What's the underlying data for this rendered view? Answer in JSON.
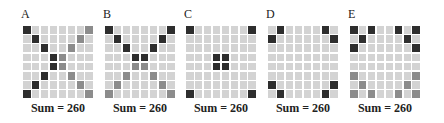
{
  "colors": {
    "dark": "#2e2e2e",
    "medium": "#8c8c8c",
    "light": "#d3d3d3",
    "gap": "#ffffff"
  },
  "panels": [
    {
      "label": "A",
      "sum_label": "Sum = 260",
      "rows": [
        "d......m",
        ".d....m.",
        "..d..m..",
        "...dm...",
        "...dm...",
        "..d..m..",
        ".d....m.",
        "d......m"
      ]
    },
    {
      "label": "B",
      "sum_label": "Sum = 260",
      "rows": [
        "d......d",
        ".d....d.",
        "..d..d..",
        "...dd...",
        "...mm...",
        "..m..m..",
        ".m....m.",
        "m......m"
      ]
    },
    {
      "label": "C",
      "sum_label": "Sum = 260",
      "rows": [
        "d......d",
        "........",
        "........",
        "...dd...",
        "...dd...",
        "........",
        "........",
        "d......d"
      ]
    },
    {
      "label": "D",
      "sum_label": "Sum = 260",
      "rows": [
        ".d....d.",
        "d......d",
        "........",
        "........",
        "........",
        "........",
        "d......d",
        ".d....d."
      ]
    },
    {
      "label": "E",
      "sum_label": "Sum = 260",
      "rows": [
        "d.d..d.d",
        ".d....d.",
        "d......d",
        "........",
        "........",
        "m......m",
        ".m....m.",
        "m.m..m.m"
      ]
    }
  ]
}
